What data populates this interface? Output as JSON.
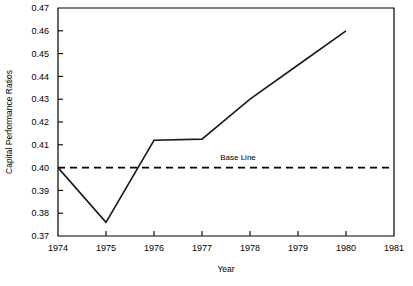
{
  "chart_data": {
    "type": "line",
    "title": "",
    "subtitle": "",
    "xlabel": "Year",
    "ylabel": "Capital Performance Ratios",
    "x": [
      1974,
      1975,
      1976,
      1977,
      1978,
      1979,
      1980
    ],
    "series": [
      {
        "name": "Capital Performance Ratio",
        "values": [
          0.4,
          0.376,
          0.412,
          0.4125,
          0.43,
          0.445,
          0.46
        ],
        "style": "solid"
      },
      {
        "name": "Base Line",
        "constant": 0.4,
        "style": "dashed"
      }
    ],
    "annotations": [
      {
        "text": "Base Line",
        "x": 1977.75,
        "y": 0.4035
      }
    ],
    "xlim": [
      1974,
      1981
    ],
    "ylim": [
      0.37,
      0.47
    ],
    "xticks": [
      1974,
      1975,
      1976,
      1977,
      1978,
      1979,
      1980,
      1981
    ],
    "xticklabels": [
      "1974",
      "1975",
      "1976",
      "1977",
      "1978",
      "1979",
      "1980",
      "1981"
    ],
    "yticks": [
      0.37,
      0.38,
      0.39,
      0.4,
      0.41,
      0.42,
      0.43,
      0.44,
      0.45,
      0.46,
      0.47
    ],
    "yticklabels": [
      "0.37",
      "0.38",
      "0.39",
      "0.40",
      "0.41",
      "0.42",
      "0.43",
      "0.44",
      "0.45",
      "0.46",
      "0.47"
    ],
    "grid": false,
    "legend": "none",
    "line_color": "#1a1a1a",
    "axis_color": "#000000",
    "background_color": "#ffffff"
  }
}
